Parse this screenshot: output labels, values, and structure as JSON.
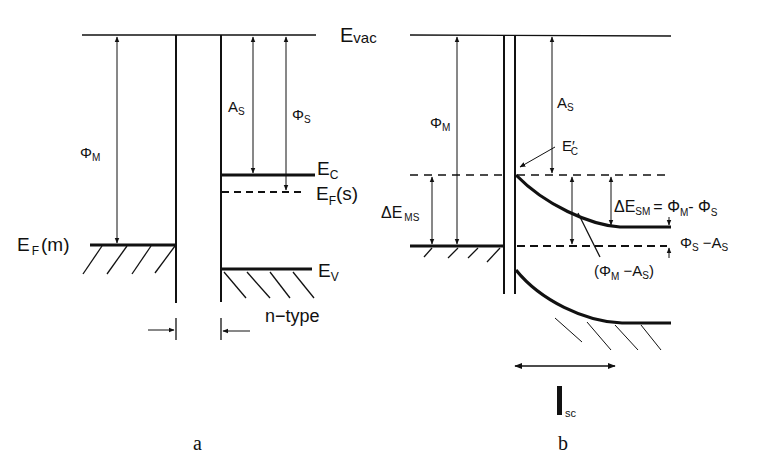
{
  "labels": {
    "evac": "E",
    "evac_sub": "vac",
    "a": {
      "phi_m": "Φ",
      "phi_m_sub": "M",
      "as": "A",
      "as_sub": "S",
      "phi_s": "Φ",
      "phi_s_sub": "S",
      "ec": "E",
      "ec_sub": "C",
      "ef_s": "E",
      "ef_s_sub": "F",
      "ef_s_tail": "(s)",
      "ef_m": "E",
      "ef_m_sub": "F",
      "ef_m_tail": "(m)",
      "ev": "E",
      "ev_sub": "V",
      "ntype": "n−type",
      "caption": "a"
    },
    "b": {
      "phi_m": "Φ",
      "phi_m_sub": "M",
      "as": "A",
      "as_sub": "S",
      "ec_prime": "E′",
      "ec_prime_sub": "C",
      "de_ms": "ΔE",
      "de_ms_sub": "MS",
      "de_sm": "ΔE",
      "de_sm_sub": "SM",
      "de_sm_eq": "= Φ",
      "de_sm_eq_sub1": "M",
      "de_sm_eq_mid": "- Φ",
      "de_sm_eq_sub2": "S",
      "phis_as": "Φ",
      "phis_as_sub": "S",
      "phis_as_tail": " −A",
      "phis_as_sub2": "S",
      "phim_as_open": "(Φ",
      "phim_as_sub": "M",
      "phim_as_mid": " −A",
      "phim_as_sub2": "S",
      "phim_as_close": ")",
      "isc": "l",
      "isc_sub": "sc",
      "caption": "b"
    }
  }
}
